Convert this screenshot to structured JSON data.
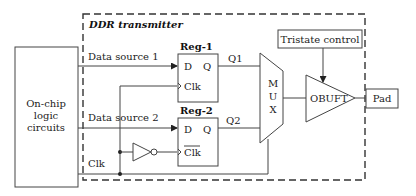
{
  "diagram": {
    "container_label": "DDR transmitter",
    "logic_block": {
      "line1": "On-chip",
      "line2": "logic",
      "line3": "circuits"
    },
    "signals": {
      "data_source_1": "Data source 1",
      "data_source_2": "Data source 2",
      "clk": "Clk",
      "q1": "Q1",
      "q2": "Q2"
    },
    "reg1": {
      "title": "Reg-1",
      "d": "D",
      "q": "Q",
      "clk": "Clk"
    },
    "reg2": {
      "title": "Reg-2",
      "d": "D",
      "q": "Q",
      "clk": "Clk"
    },
    "mux": {
      "m": "M",
      "u": "U",
      "x": "X"
    },
    "obuft": "OBUFT",
    "tristate": "Tristate control",
    "pad": "Pad"
  }
}
